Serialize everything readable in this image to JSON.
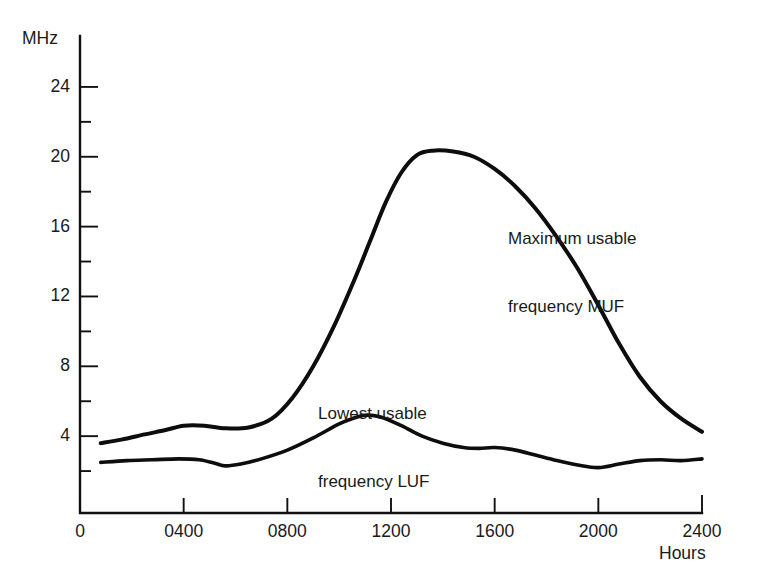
{
  "chart_data": {
    "type": "line",
    "title": "",
    "xlabel": "Hours",
    "ylabel": "MHz",
    "xlim": [
      0,
      2400
    ],
    "ylim": [
      0,
      26
    ],
    "grid": false,
    "legend_position": "inline-annotations",
    "x_ticks": [
      {
        "value": 0,
        "label": "0"
      },
      {
        "value": 400,
        "label": "0400"
      },
      {
        "value": 800,
        "label": "0800"
      },
      {
        "value": 1200,
        "label": "1200"
      },
      {
        "value": 1600,
        "label": "1600"
      },
      {
        "value": 2000,
        "label": "2000"
      },
      {
        "value": 2400,
        "label": "2400"
      }
    ],
    "y_ticks_major": [
      {
        "value": 4,
        "label": "4"
      },
      {
        "value": 8,
        "label": "8"
      },
      {
        "value": 12,
        "label": "12"
      },
      {
        "value": 16,
        "label": "16"
      },
      {
        "value": 20,
        "label": "20"
      },
      {
        "value": 24,
        "label": "24"
      }
    ],
    "y_ticks_minor": [
      2,
      6,
      10,
      14,
      18,
      22
    ],
    "series": [
      {
        "name": "Maximum usable frequency MUF",
        "annotation": "Maximum usable\nfrequency MUF",
        "annotation_line1": "Maximum usable",
        "annotation_line2": "frequency MUF",
        "color": "#0d0d0d",
        "x": [
          80,
          160,
          250,
          330,
          400,
          480,
          560,
          650,
          740,
          820,
          900,
          980,
          1060,
          1120,
          1180,
          1240,
          1300,
          1360,
          1440,
          1520,
          1600,
          1680,
          1760,
          1840,
          1920,
          2000,
          2080,
          2160,
          2240,
          2320,
          2400
        ],
        "y": [
          3.6,
          3.8,
          4.1,
          4.35,
          4.6,
          4.6,
          4.45,
          4.5,
          5.0,
          6.2,
          8.0,
          10.3,
          13.0,
          15.2,
          17.4,
          19.1,
          20.1,
          20.35,
          20.3,
          20.0,
          19.3,
          18.3,
          17.0,
          15.4,
          13.6,
          11.5,
          9.3,
          7.4,
          6.0,
          5.0,
          4.25
        ]
      },
      {
        "name": "Lowest usable frequency LUF",
        "annotation": "Lowest usable\nfrequency LUF",
        "annotation_line1": "Lowest usable",
        "annotation_line2": "frequency LUF",
        "color": "#0d0d0d",
        "x": [
          80,
          180,
          280,
          380,
          460,
          520,
          560,
          620,
          700,
          800,
          900,
          1000,
          1060,
          1100,
          1160,
          1240,
          1320,
          1400,
          1480,
          1540,
          1600,
          1680,
          1760,
          1840,
          1920,
          2000,
          2080,
          2160,
          2240,
          2320,
          2400
        ],
        "y": [
          2.5,
          2.6,
          2.65,
          2.7,
          2.65,
          2.45,
          2.3,
          2.4,
          2.7,
          3.2,
          3.9,
          4.7,
          5.05,
          5.2,
          5.1,
          4.6,
          4.0,
          3.6,
          3.35,
          3.3,
          3.35,
          3.2,
          2.9,
          2.6,
          2.35,
          2.2,
          2.4,
          2.6,
          2.65,
          2.6,
          2.7
        ]
      }
    ]
  },
  "axes": {
    "y_unit_label": "MHz",
    "x_unit_label": "Hours"
  },
  "annotations": {
    "muf_line1": "Maximum usable",
    "muf_line2": "frequency MUF",
    "luf_line1": "Lowest usable",
    "luf_line2": "frequency LUF"
  },
  "tick_labels": {
    "y": [
      "24",
      "20",
      "16",
      "12",
      "8",
      "4"
    ],
    "x": [
      "0",
      "0400",
      "0800",
      "1200",
      "1600",
      "2000",
      "2400"
    ]
  },
  "colors": {
    "curve": "#0d0d0d",
    "axis": "#111111",
    "background": "#ffffff",
    "text": "#1a1a1a"
  }
}
